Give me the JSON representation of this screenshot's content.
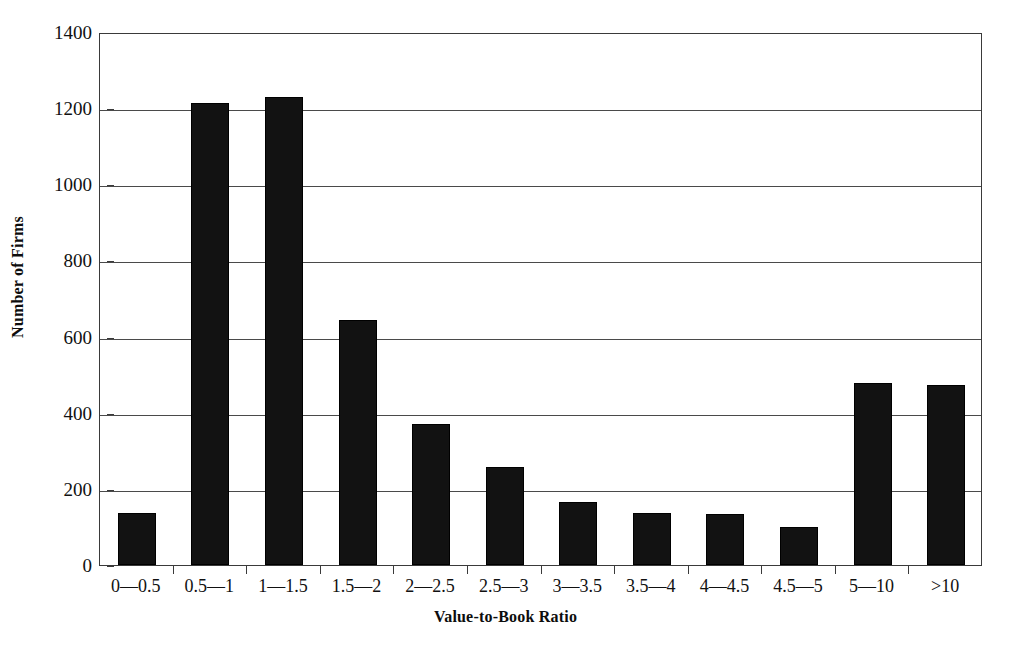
{
  "chart_data": {
    "type": "bar",
    "title": "",
    "xlabel": "Value-to-Book Ratio",
    "ylabel": "Number of Firms",
    "categories": [
      "0—0.5",
      "0.5—1",
      "1—1.5",
      "1.5—2",
      "2—2.5",
      "2.5—3",
      "3—3.5",
      "3.5—4",
      "4—4.5",
      "4.5—5",
      "5—10",
      ">10"
    ],
    "values": [
      137,
      1213,
      1228,
      643,
      371,
      258,
      165,
      137,
      134,
      101,
      478,
      472
    ],
    "ylim": [
      0,
      1400
    ],
    "yticks": [
      0,
      200,
      400,
      600,
      800,
      1000,
      1200,
      1400
    ],
    "ytick_labels": [
      "0",
      "200",
      "400",
      "600",
      "800",
      "1000",
      "1200",
      "1400"
    ],
    "grid": true,
    "legend": false,
    "bar_color": "#121212",
    "axis_color": "#3a3a3a"
  }
}
